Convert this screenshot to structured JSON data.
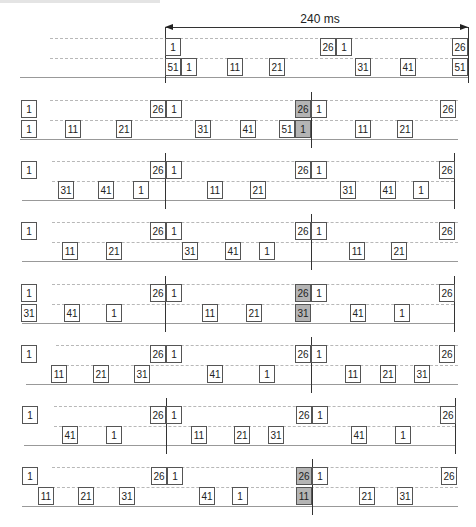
{
  "header": {
    "scale_label": "240 ms"
  },
  "colors": {
    "box_border": "#555555",
    "highlight": "#b4b4b4",
    "dash": "#b8b8b8",
    "baseline": "#999999"
  },
  "rows": [
    {
      "top": 36,
      "vlines": [
        165,
        468
      ],
      "baseline": [
        20,
        468
      ],
      "upper": [
        {
          "x": 165,
          "label": "1"
        },
        {
          "x": 320,
          "label": "26"
        },
        {
          "x": 336,
          "label": "1"
        },
        {
          "x": 452,
          "label": "26"
        }
      ],
      "lower": [
        {
          "x": 165,
          "label": "51"
        },
        {
          "x": 181,
          "label": "1"
        },
        {
          "x": 227,
          "label": "11"
        },
        {
          "x": 269,
          "label": "21"
        },
        {
          "x": 355,
          "label": "31"
        },
        {
          "x": 400,
          "label": "41"
        },
        {
          "x": 452,
          "label": "51"
        }
      ]
    },
    {
      "top": 98,
      "vlines": [
        311
      ],
      "baseline": [
        20,
        458
      ],
      "upper": [
        {
          "x": 21,
          "label": "1"
        },
        {
          "x": 150,
          "label": "26"
        },
        {
          "x": 166,
          "label": "1",
          "hl": false
        },
        {
          "x": 295,
          "label": "26",
          "hl": true
        },
        {
          "x": 311,
          "label": "1"
        },
        {
          "x": 440,
          "label": "26"
        }
      ],
      "lower": [
        {
          "x": 21,
          "label": "1"
        },
        {
          "x": 65,
          "label": "11"
        },
        {
          "x": 116,
          "label": "21"
        },
        {
          "x": 195,
          "label": "31"
        },
        {
          "x": 240,
          "label": "41"
        },
        {
          "x": 279,
          "label": "51"
        },
        {
          "x": 295,
          "label": "1",
          "hl": true
        },
        {
          "x": 355,
          "label": "11"
        },
        {
          "x": 397,
          "label": "21"
        }
      ]
    },
    {
      "top": 159,
      "vlines": [
        165,
        454
      ],
      "baseline": [
        22,
        454
      ],
      "upper": [
        {
          "x": 21,
          "label": "1"
        },
        {
          "x": 150,
          "label": "26"
        },
        {
          "x": 166,
          "label": "1"
        },
        {
          "x": 295,
          "label": "26"
        },
        {
          "x": 311,
          "label": "1"
        },
        {
          "x": 439,
          "label": "26"
        }
      ],
      "lower": [
        {
          "x": 58,
          "label": "31"
        },
        {
          "x": 98,
          "label": "41"
        },
        {
          "x": 133,
          "label": "1"
        },
        {
          "x": 207,
          "label": "11"
        },
        {
          "x": 250,
          "label": "21"
        },
        {
          "x": 340,
          "label": "31"
        },
        {
          "x": 380,
          "label": "41"
        },
        {
          "x": 413,
          "label": "1"
        }
      ]
    },
    {
      "top": 220,
      "vlines": [
        311
      ],
      "baseline": [
        22,
        458
      ],
      "upper": [
        {
          "x": 21,
          "label": "1"
        },
        {
          "x": 150,
          "label": "26"
        },
        {
          "x": 166,
          "label": "1"
        },
        {
          "x": 295,
          "label": "26"
        },
        {
          "x": 311,
          "label": "1"
        },
        {
          "x": 439,
          "label": "26"
        }
      ],
      "lower": [
        {
          "x": 62,
          "label": "11"
        },
        {
          "x": 106,
          "label": "21"
        },
        {
          "x": 182,
          "label": "31"
        },
        {
          "x": 225,
          "label": "41"
        },
        {
          "x": 259,
          "label": "1"
        },
        {
          "x": 349,
          "label": "11"
        },
        {
          "x": 391,
          "label": "21"
        }
      ]
    },
    {
      "top": 282,
      "vlines": [
        165,
        454
      ],
      "baseline": [
        22,
        454
      ],
      "upper": [
        {
          "x": 21,
          "label": "1"
        },
        {
          "x": 150,
          "label": "26"
        },
        {
          "x": 166,
          "label": "1"
        },
        {
          "x": 295,
          "label": "26",
          "hl": true
        },
        {
          "x": 311,
          "label": "1"
        },
        {
          "x": 439,
          "label": "26"
        }
      ],
      "lower": [
        {
          "x": 21,
          "label": "31"
        },
        {
          "x": 64,
          "label": "41"
        },
        {
          "x": 106,
          "label": "1"
        },
        {
          "x": 202,
          "label": "11"
        },
        {
          "x": 246,
          "label": "21"
        },
        {
          "x": 295,
          "label": "31",
          "hl": true
        },
        {
          "x": 350,
          "label": "41"
        },
        {
          "x": 394,
          "label": "1"
        }
      ]
    },
    {
      "top": 343,
      "vlines": [
        311
      ],
      "baseline": [
        26,
        458
      ],
      "upper": [
        {
          "x": 21,
          "label": "1"
        },
        {
          "x": 150,
          "label": "26"
        },
        {
          "x": 166,
          "label": "1"
        },
        {
          "x": 295,
          "label": "26"
        },
        {
          "x": 311,
          "label": "1"
        },
        {
          "x": 439,
          "label": "26"
        }
      ],
      "lower": [
        {
          "x": 51,
          "label": "11"
        },
        {
          "x": 93,
          "label": "21"
        },
        {
          "x": 134,
          "label": "31"
        },
        {
          "x": 207,
          "label": "41"
        },
        {
          "x": 259,
          "label": "1"
        },
        {
          "x": 345,
          "label": "11"
        },
        {
          "x": 380,
          "label": "21"
        },
        {
          "x": 414,
          "label": "31"
        }
      ]
    },
    {
      "top": 404,
      "vlines": [
        166,
        455
      ],
      "baseline": [
        24,
        455
      ],
      "upper": [
        {
          "x": 22,
          "label": "1"
        },
        {
          "x": 150,
          "label": "26"
        },
        {
          "x": 166,
          "label": "1"
        },
        {
          "x": 296,
          "label": "26"
        },
        {
          "x": 312,
          "label": "1"
        },
        {
          "x": 440,
          "label": "26"
        }
      ],
      "lower": [
        {
          "x": 62,
          "label": "41"
        },
        {
          "x": 106,
          "label": "1"
        },
        {
          "x": 191,
          "label": "11"
        },
        {
          "x": 234,
          "label": "21"
        },
        {
          "x": 268,
          "label": "31"
        },
        {
          "x": 351,
          "label": "41"
        },
        {
          "x": 395,
          "label": "1"
        }
      ]
    },
    {
      "top": 465,
      "vlines": [
        312
      ],
      "baseline": [
        22,
        458
      ],
      "upper": [
        {
          "x": 22,
          "label": "1"
        },
        {
          "x": 151,
          "label": "26"
        },
        {
          "x": 167,
          "label": "1"
        },
        {
          "x": 296,
          "label": "26",
          "hl": true
        },
        {
          "x": 312,
          "label": "1"
        },
        {
          "x": 441,
          "label": "26"
        }
      ],
      "lower": [
        {
          "x": 38,
          "label": "11"
        },
        {
          "x": 78,
          "label": "21"
        },
        {
          "x": 119,
          "label": "31"
        },
        {
          "x": 199,
          "label": "41"
        },
        {
          "x": 232,
          "label": "1"
        },
        {
          "x": 296,
          "label": "11",
          "hl": true
        },
        {
          "x": 359,
          "label": "21"
        },
        {
          "x": 397,
          "label": "31"
        }
      ]
    }
  ]
}
